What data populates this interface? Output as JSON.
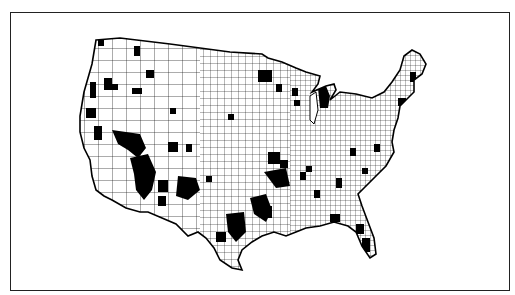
{
  "figure": {
    "type": "county choropleth map",
    "region": "Contiguous United States",
    "legend": null,
    "title": null,
    "colors": {
      "background": "#ffffff",
      "border": "#222222",
      "county_line": "#111111",
      "highlighted_fill": "#000000",
      "default_fill": "#ffffff"
    },
    "categories": [
      {
        "label": "highlighted counties",
        "fill": "#000000"
      },
      {
        "label": "other counties",
        "fill": "#ffffff"
      }
    ],
    "highlighted_regions": [
      "Western Washington / Oregon coast",
      "Northern California",
      "Central & Southern Nevada",
      "Southern California / Arizona desert",
      "Southern Arizona / New Mexico",
      "Central & West Texas",
      "Oklahoma / Kansas",
      "Upper Michigan & Wisconsin",
      "Minnesota north",
      "Maine coast",
      "Georgia / Alabama",
      "Florida peninsula"
    ]
  }
}
